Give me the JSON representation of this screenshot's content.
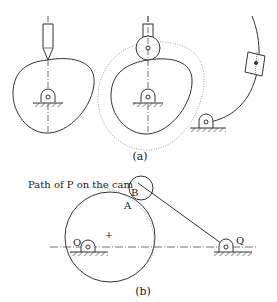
{
  "figure": {
    "panel_a": {
      "caption": "(a)",
      "mechanisms": [
        {
          "name": "knife-edge follower on cam"
        },
        {
          "name": "roller follower on cam"
        },
        {
          "name": "oscillating slider on arc"
        }
      ]
    },
    "panel_b": {
      "caption": "(b)",
      "path_label": "Path of P on the cam",
      "point_labels": {
        "A": "A",
        "B": "B",
        "O": "O",
        "Q": "Q",
        "center_mark": "+"
      }
    }
  },
  "colors": {
    "line": "#333333",
    "dotted": "#888888",
    "background": "#ffffff"
  }
}
